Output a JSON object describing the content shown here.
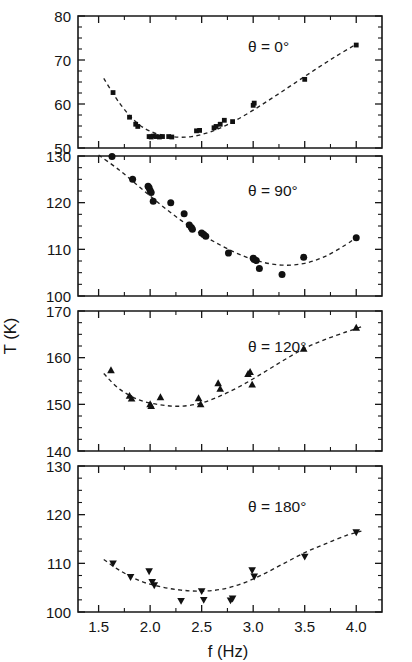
{
  "figure": {
    "background": "#ffffff",
    "ink_color": "#141414",
    "axis_title_y": "T (K)",
    "axis_title_x": "f (Hz)"
  },
  "chart_data": [
    {
      "type": "scatter",
      "panel_index": 0,
      "annotation": "θ = 0°",
      "title": "",
      "xlabel": "",
      "ylabel": "T (K)",
      "xlim": [
        1.3,
        4.25
      ],
      "ylim": [
        50,
        80
      ],
      "ytick_labels": [
        "50",
        "60",
        "70",
        "80"
      ],
      "yticks": [
        50,
        60,
        70,
        80
      ],
      "yminor_step": 2.5,
      "xticks": [
        1.5,
        2.0,
        2.5,
        3.0,
        3.5,
        4.0
      ],
      "xtick_labels": [
        "1.5",
        "2.0",
        "2.5",
        "3.0",
        "3.5",
        "4.0"
      ],
      "xminor_step": 0.25,
      "grid": false,
      "marker": "square",
      "marker_color": "#111111",
      "fit_style": "dashed",
      "x": [
        1.64,
        1.8,
        1.86,
        1.88,
        1.99,
        2.01,
        2.03,
        2.06,
        2.09,
        2.12,
        2.18,
        2.21,
        2.45,
        2.48,
        2.62,
        2.64,
        2.68,
        2.72,
        2.8,
        3.0,
        3.01,
        3.5,
        4.0
      ],
      "y": [
        62.6,
        57.0,
        55.4,
        54.9,
        52.6,
        52.5,
        52.7,
        52.6,
        52.5,
        52.6,
        52.6,
        52.5,
        53.9,
        54.0,
        54.6,
        54.9,
        55.4,
        56.3,
        56.0,
        59.7,
        60.2,
        65.6,
        73.4
      ],
      "fit_x": [
        1.55,
        1.7,
        1.85,
        2.0,
        2.2,
        2.4,
        2.6,
        2.8,
        3.0,
        3.2,
        3.4,
        3.6,
        3.8,
        4.0
      ],
      "fit_y": [
        65.8,
        60.3,
        56.2,
        53.8,
        52.6,
        52.6,
        53.8,
        55.9,
        58.6,
        61.6,
        64.7,
        67.8,
        70.8,
        73.6
      ]
    },
    {
      "type": "scatter",
      "panel_index": 1,
      "annotation": "θ = 90°",
      "title": "",
      "xlabel": "",
      "ylabel": "T (K)",
      "xlim": [
        1.3,
        4.25
      ],
      "ylim": [
        100,
        130
      ],
      "ytick_labels": [
        "100",
        "110",
        "120",
        "130"
      ],
      "yticks": [
        100,
        110,
        120,
        130
      ],
      "yminor_step": 2.5,
      "xticks": [
        1.5,
        2.0,
        2.5,
        3.0,
        3.5,
        4.0
      ],
      "xtick_labels": [
        "1.5",
        "2.0",
        "2.5",
        "3.0",
        "3.5",
        "4.0"
      ],
      "xminor_step": 0.25,
      "grid": false,
      "marker": "circle",
      "marker_color": "#111111",
      "fit_style": "dashed",
      "x": [
        1.63,
        1.83,
        1.98,
        1.99,
        2.0,
        2.01,
        2.03,
        2.2,
        2.33,
        2.38,
        2.4,
        2.41,
        2.5,
        2.52,
        2.54,
        2.76,
        3.0,
        3.01,
        3.03,
        3.06,
        3.28,
        3.49,
        4.0
      ],
      "y": [
        129.9,
        125.0,
        123.5,
        123.2,
        122.6,
        122.2,
        120.3,
        120.0,
        117.6,
        115.2,
        114.7,
        114.3,
        113.5,
        113.2,
        112.8,
        109.2,
        108.1,
        107.8,
        107.6,
        105.9,
        104.6,
        108.3,
        112.5
      ],
      "fit_x": [
        1.5,
        1.7,
        1.9,
        2.1,
        2.3,
        2.5,
        2.7,
        2.9,
        3.1,
        3.3,
        3.5,
        3.7,
        3.9,
        4.0
      ],
      "fit_y": [
        130.2,
        127.0,
        123.3,
        119.6,
        116.2,
        113.2,
        110.7,
        108.6,
        107.2,
        106.6,
        107.0,
        108.5,
        111.0,
        112.6
      ]
    },
    {
      "type": "scatter",
      "panel_index": 2,
      "annotation": "θ = 120°",
      "title": "",
      "xlabel": "",
      "ylabel": "T (K)",
      "xlim": [
        1.3,
        4.25
      ],
      "ylim": [
        140,
        170
      ],
      "ytick_labels": [
        "140",
        "150",
        "160",
        "170"
      ],
      "yticks": [
        140,
        150,
        160,
        170
      ],
      "yminor_step": 2.5,
      "xticks": [
        1.5,
        2.0,
        2.5,
        3.0,
        3.5,
        4.0
      ],
      "xtick_labels": [
        "1.5",
        "2.0",
        "2.5",
        "3.0",
        "3.5",
        "4.0"
      ],
      "xminor_step": 0.25,
      "grid": false,
      "marker": "triangle-up",
      "marker_color": "#111111",
      "fit_style": "dashed",
      "x": [
        1.62,
        1.8,
        1.82,
        2.0,
        2.01,
        2.1,
        2.47,
        2.49,
        2.66,
        2.68,
        2.95,
        2.97,
        2.99,
        3.49,
        4.0
      ],
      "y": [
        157.3,
        151.8,
        151.2,
        150.0,
        149.6,
        151.5,
        151.3,
        150.0,
        154.5,
        153.3,
        156.5,
        156.9,
        154.2,
        161.9,
        166.4
      ],
      "fit_x": [
        1.55,
        1.7,
        1.9,
        2.1,
        2.3,
        2.5,
        2.7,
        2.9,
        3.1,
        3.3,
        3.5,
        3.7,
        3.9,
        4.05
      ],
      "fit_y": [
        156.6,
        153.3,
        150.9,
        149.9,
        149.6,
        150.3,
        152.0,
        154.2,
        156.8,
        159.5,
        162.0,
        163.9,
        165.5,
        166.6
      ]
    },
    {
      "type": "scatter",
      "panel_index": 3,
      "annotation": "θ = 180°",
      "title": "",
      "xlabel": "f (Hz)",
      "ylabel": "T (K)",
      "xlim": [
        1.3,
        4.25
      ],
      "ylim": [
        100,
        130
      ],
      "ytick_labels": [
        "100",
        "110",
        "120",
        "130"
      ],
      "yticks": [
        100,
        110,
        120,
        130
      ],
      "yminor_step": 2.5,
      "xticks": [
        1.5,
        2.0,
        2.5,
        3.0,
        3.5,
        4.0
      ],
      "xtick_labels": [
        "1.5",
        "2.0",
        "2.5",
        "3.0",
        "3.5",
        "4.0"
      ],
      "xminor_step": 0.25,
      "grid": false,
      "marker": "triangle-down",
      "marker_color": "#111111",
      "fit_style": "dashed",
      "x": [
        1.64,
        1.81,
        1.99,
        2.02,
        2.04,
        2.3,
        2.5,
        2.52,
        2.78,
        2.8,
        2.99,
        3.01,
        3.5,
        4.0
      ],
      "y": [
        110.0,
        107.2,
        108.4,
        106.2,
        105.5,
        102.3,
        104.3,
        102.5,
        102.4,
        102.8,
        108.6,
        107.3,
        111.4,
        116.4
      ],
      "fit_x": [
        1.55,
        1.7,
        1.9,
        2.1,
        2.3,
        2.5,
        2.7,
        2.9,
        3.1,
        3.3,
        3.5,
        3.7,
        3.9,
        4.05
      ],
      "fit_y": [
        110.8,
        108.6,
        106.4,
        105.2,
        104.5,
        104.3,
        104.7,
        105.9,
        107.8,
        110.0,
        112.2,
        114.0,
        115.7,
        116.6
      ]
    }
  ]
}
